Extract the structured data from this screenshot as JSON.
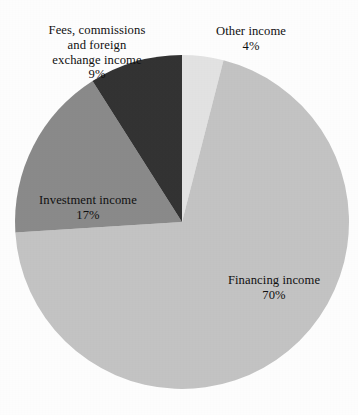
{
  "chart_data": {
    "type": "pie",
    "title": "",
    "subtitle": "",
    "xlabel": "",
    "ylabel": "",
    "legend_position": "none",
    "grid": false,
    "labels_placement": "on-and-around-slices",
    "start_angle_deg": 0,
    "direction": "clockwise",
    "categories": [
      "Other income",
      "Financing income",
      "Investment income",
      "Fees, commissions and foreign exchange income"
    ],
    "values": [
      4,
      70,
      17,
      9
    ],
    "value_unit": "%",
    "colors": [
      "#e2e2e2",
      "#c3c3c3",
      "#8a8a8a",
      "#333333"
    ],
    "slices": [
      {
        "name": "Other income",
        "value": 4,
        "value_label": "4%",
        "color": "#e2e2e2",
        "start_deg": 0,
        "end_deg": 14.4,
        "label_placement": "outside-top"
      },
      {
        "name": "Financing income",
        "value": 70,
        "value_label": "70%",
        "color": "#c3c3c3",
        "start_deg": 14.4,
        "end_deg": 266.4,
        "label_placement": "inside"
      },
      {
        "name": "Investment income",
        "value": 17,
        "value_label": "17%",
        "color": "#8a8a8a",
        "start_deg": 266.4,
        "end_deg": 327.6,
        "label_placement": "inside"
      },
      {
        "name": "Fees, commissions and foreign exchange income",
        "value": 9,
        "value_label": "9%",
        "color": "#333333",
        "start_deg": 327.6,
        "end_deg": 360,
        "label_placement": "outside-top-left"
      }
    ]
  },
  "labels": {
    "fees": {
      "name": "Fees, commissions\nand foreign\nexchange income",
      "percent": "9%"
    },
    "other": {
      "name": "Other income",
      "percent": "4%"
    },
    "investment": {
      "name": "Investment income",
      "percent": "17%"
    },
    "financing": {
      "name": "Financing income",
      "percent": "70%"
    }
  },
  "geometry": {
    "center_x": 182,
    "center_y": 222,
    "radius": 167
  },
  "palette": {
    "background": "#fdfdfd",
    "text": "#101010",
    "other_income": "#e2e2e2",
    "financing_income": "#c3c3c3",
    "investment_income": "#8a8a8a",
    "fees_income": "#333333"
  }
}
